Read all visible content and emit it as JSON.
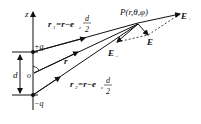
{
  "diagram": {
    "labels": {
      "axis_z": "z",
      "point_P": "P(r,θ,φ)",
      "plus_q": "+q",
      "minus_q": "−q",
      "origin": "o",
      "distance_d": "d",
      "vector_r": "r",
      "r1_formula_lhs": "r",
      "r1_sub": "1",
      "r1_formula_rhs": "=r−e",
      "r1_e_sub": "z",
      "r2_formula_lhs": "r",
      "r2_sub": "2",
      "r2_formula_rhs": "=r−e",
      "r2_e_sub": "z",
      "frac_num": "d",
      "frac_den": "2",
      "E_plus": "E",
      "E_plus_sub": "+",
      "E_minus": "E",
      "E_minus_sub": "−",
      "E_total": "E"
    },
    "colors": {
      "ink": "#111111"
    }
  }
}
